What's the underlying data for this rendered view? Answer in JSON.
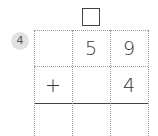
{
  "problem": {
    "number": "4",
    "carry_box": "",
    "rows": [
      [
        "",
        "5",
        "9"
      ],
      [
        "+",
        "",
        "4"
      ],
      [
        "",
        "",
        ""
      ]
    ]
  }
}
